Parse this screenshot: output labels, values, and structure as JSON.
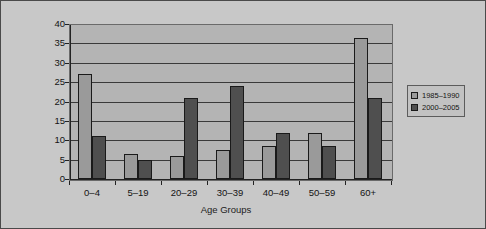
{
  "chart_data": {
    "type": "bar",
    "title": "",
    "xlabel": "Age Groups",
    "ylabel": "Percentage of Total Deaths",
    "categories": [
      "0–4",
      "5–19",
      "20–29",
      "30–39",
      "40–49",
      "50–59",
      "60+"
    ],
    "series": [
      {
        "name": "1985–1990",
        "color": "#9a9a9a",
        "values": [
          27,
          6.5,
          6,
          7.5,
          8.5,
          12,
          36.5
        ]
      },
      {
        "name": "2000–2005",
        "color": "#4f4f4f",
        "values": [
          11,
          5,
          21,
          24,
          12,
          8.5,
          21
        ]
      }
    ],
    "ylim": [
      0,
      40
    ],
    "yticks": [
      0,
      5,
      10,
      15,
      20,
      25,
      30,
      35,
      40
    ],
    "ytick_labels": [
      "0",
      "5",
      "10",
      "15",
      "20",
      "25",
      "30",
      "35",
      "40"
    ],
    "grid": true,
    "grid_axis": "y",
    "legend_position": "right",
    "plot_background": "#b4b4b4",
    "figure_background": "#c8c8c8"
  }
}
